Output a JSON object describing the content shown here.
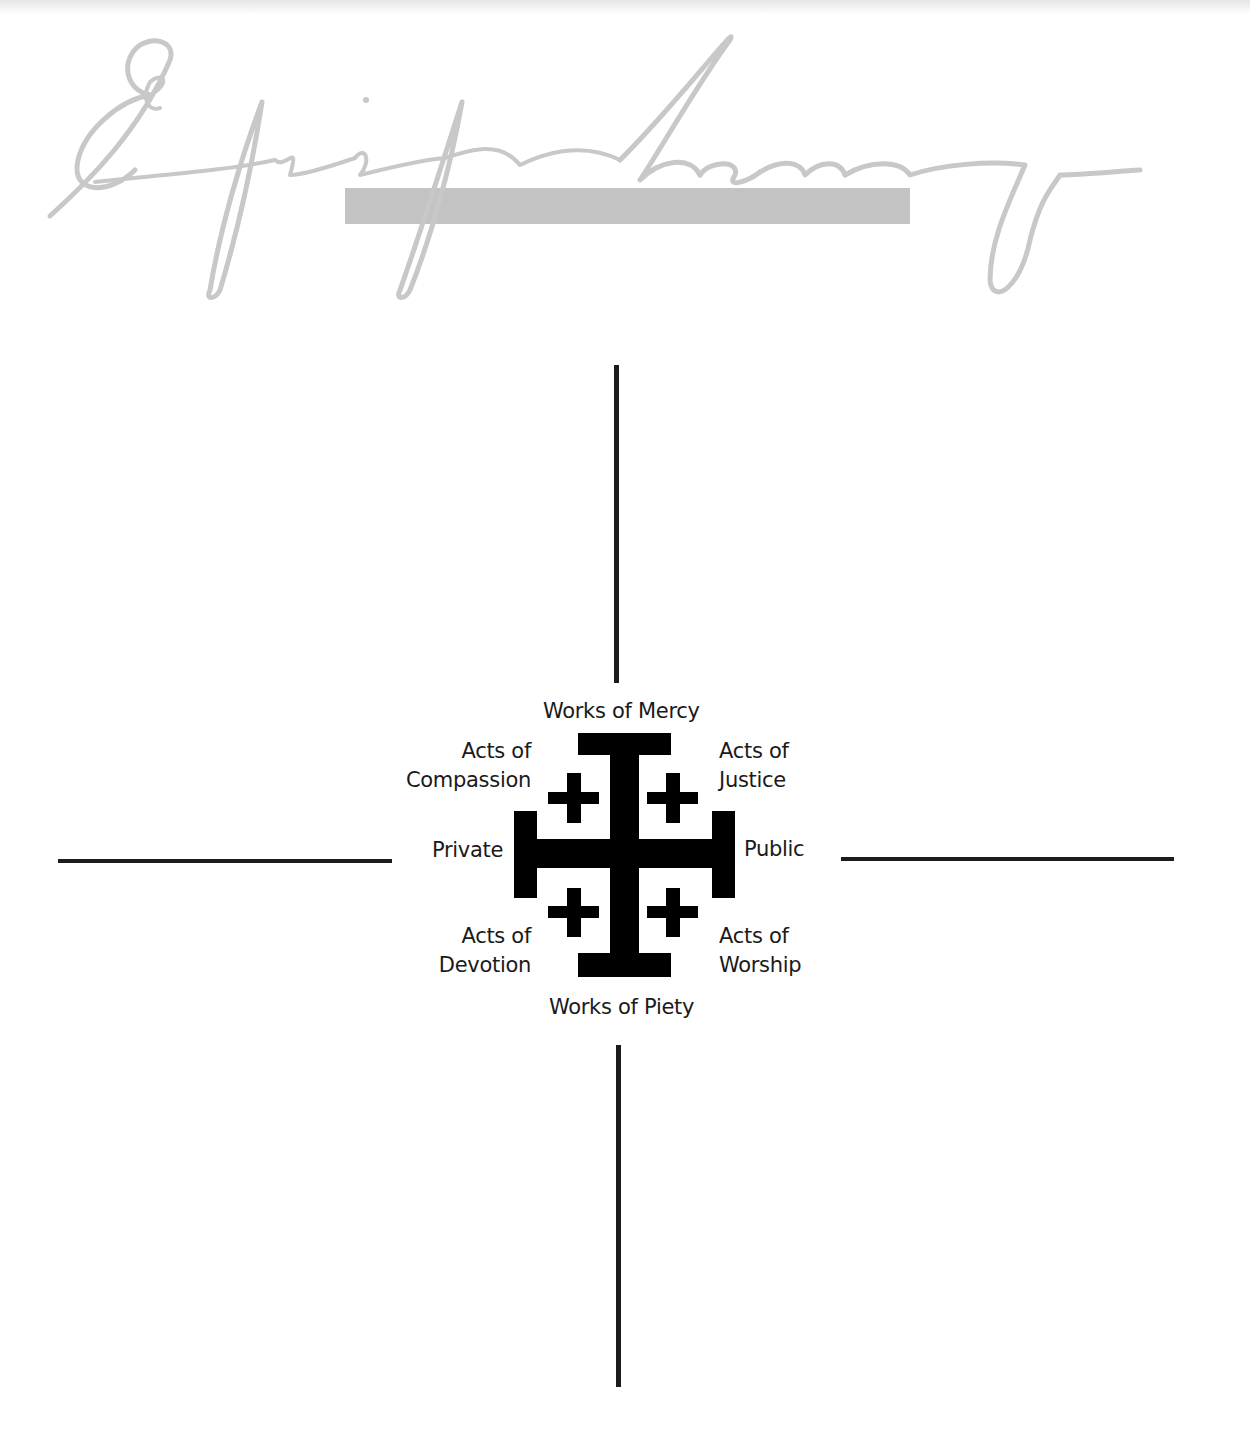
{
  "header": {
    "title": "Epiphany",
    "title_style": "script",
    "title_color": "#c8c8c8",
    "bar_color": "#c3c3c3"
  },
  "diagram": {
    "type": "jerusalem-cross-quadrant",
    "axis_color": "#1c1c1c",
    "cross_color": "#000000",
    "labels": {
      "top": "Works of Mercy",
      "bottom": "Works of Piety",
      "left": "Private",
      "right": "Public",
      "top_left": [
        "Acts of",
        "Compassion"
      ],
      "top_right": [
        "Acts of",
        "Justice"
      ],
      "bottom_left": [
        "Acts of",
        "Devotion"
      ],
      "bottom_right": [
        "Acts of",
        "Worship"
      ]
    },
    "quadrants": [
      {
        "position": "top-left",
        "content": ""
      },
      {
        "position": "top-right",
        "content": ""
      },
      {
        "position": "bottom-left",
        "content": ""
      },
      {
        "position": "bottom-right",
        "content": ""
      }
    ]
  }
}
